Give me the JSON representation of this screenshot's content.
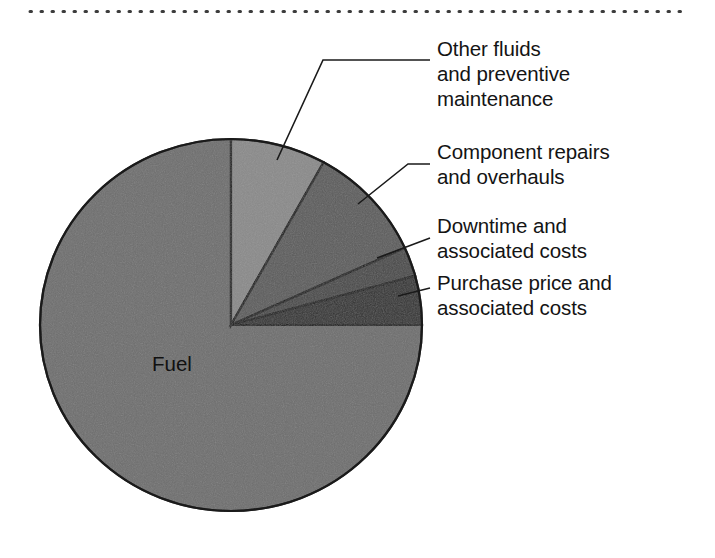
{
  "figure": {
    "background_color": "#ffffff",
    "top_rule": {
      "name": "dotted-rule",
      "color": "#3c3c3c"
    }
  },
  "chart_data": {
    "type": "pie",
    "title": "",
    "subtitle": "",
    "xlabel": "",
    "ylabel": "",
    "legend_position": "callout-labels-right",
    "grid": false,
    "start_angle_deg": 0,
    "direction": "clockwise",
    "center": {
      "x": 231,
      "y": 325
    },
    "radius": {
      "rx": 191,
      "ry": 186
    },
    "categories": [
      "Fuel",
      "Other fluids and preventive maintenance",
      "Component repairs and overhauls",
      "Downtime and associated costs",
      "Purchase price and associated costs"
    ],
    "values": [
      75.0,
      8.1,
      10.1,
      2.6,
      4.2
    ],
    "units": "percent of total operating cost",
    "slices": [
      {
        "label": "Fuel",
        "label_placement": "inside",
        "value": 75.0,
        "start_angle_deg": 90,
        "end_angle_deg": 360,
        "color": "#6e6e6e"
      },
      {
        "label": "Other fluids and preventive maintenance",
        "label_placement": "callout",
        "value": 8.1,
        "start_angle_deg": 0,
        "end_angle_deg": 29,
        "color": "#8a8a8a"
      },
      {
        "label": "Component repairs and overhauls",
        "label_placement": "callout",
        "value": 10.1,
        "start_angle_deg": 29,
        "end_angle_deg": 65.5,
        "color": "#5c5c5c"
      },
      {
        "label": "Downtime and associated costs",
        "label_placement": "callout",
        "value": 2.6,
        "start_angle_deg": 65.5,
        "end_angle_deg": 74.7,
        "color": "#494949"
      },
      {
        "label": "Purchase price and associated costs",
        "label_placement": "callout",
        "value": 4.2,
        "start_angle_deg": 74.7,
        "end_angle_deg": 90,
        "color": "#333333"
      }
    ]
  },
  "labels": {
    "fuel": "Fuel",
    "other_fluids": "Other fluids\nand preventive\nmaintenance",
    "component_repairs": "Component repairs\nand overhauls",
    "downtime": "Downtime and\nassociated costs",
    "purchase_price": "Purchase price and\nassociated costs"
  },
  "colors": {
    "outline": "#1a1a1a",
    "leader_line": "#1a1a1a",
    "text": "#141414",
    "slice_fuel": "#6e6e6e",
    "slice_other_fluids": "#8a8a8a",
    "slice_component": "#5c5c5c",
    "slice_downtime": "#494949",
    "slice_purchase": "#333333"
  }
}
